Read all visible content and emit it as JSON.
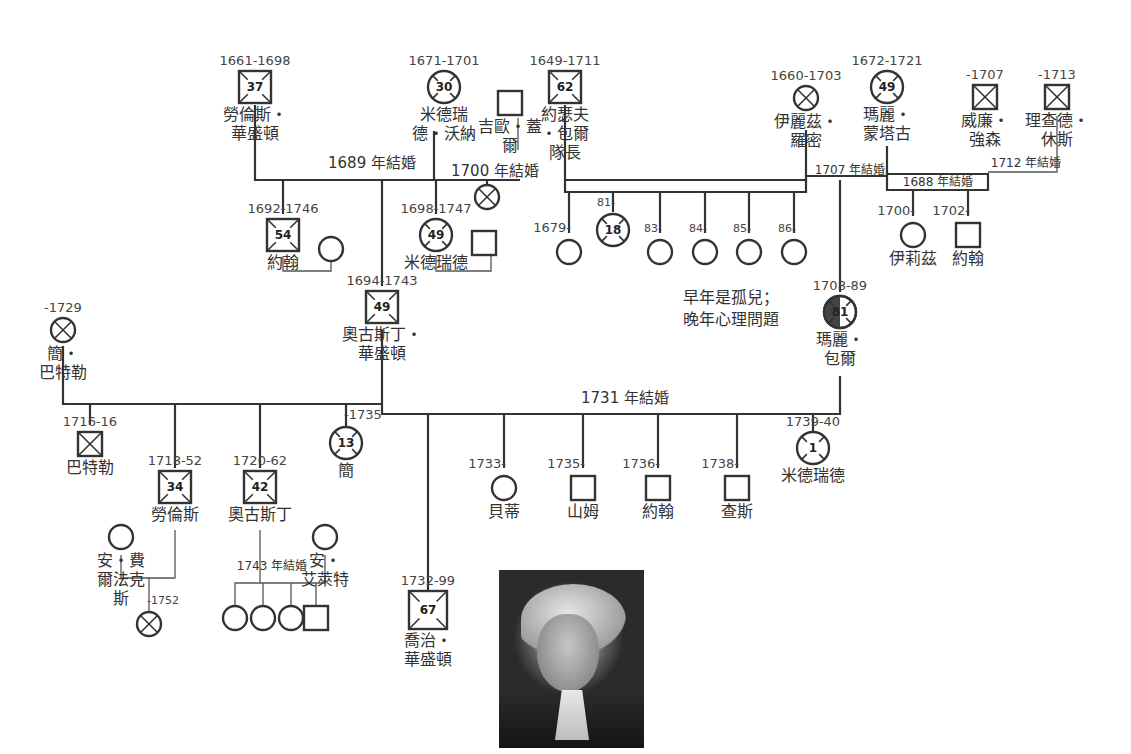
{
  "people": [
    {
      "id": "lawrence_sr",
      "sex": "M",
      "shape": "square",
      "deceased": true,
      "age": "37",
      "x": 255,
      "y": 87,
      "years": "1661-1698",
      "name": [
        "勞倫斯・",
        "華盛頓"
      ]
    },
    {
      "id": "mildred_warner",
      "sex": "F",
      "shape": "circle",
      "deceased": true,
      "age": "30",
      "x": 444,
      "y": 87,
      "years": "1671-1701",
      "name": [
        "米德瑞",
        "德・沃納"
      ]
    },
    {
      "id": "george_gale",
      "sex": "M",
      "shape": "square",
      "deceased": false,
      "x": 510,
      "y": 103,
      "name": [
        "吉歐・蓋",
        "爾"
      ]
    },
    {
      "id": "joseph_ball",
      "sex": "M",
      "shape": "square",
      "deceased": true,
      "age": "62",
      "x": 565,
      "y": 87,
      "years": "1649-1711",
      "name": [
        "約瑟夫",
        "・包爾",
        "隊長"
      ]
    },
    {
      "id": "elizabeth_romney",
      "sex": "F",
      "shape": "circle",
      "deceased": true,
      "x": 806,
      "y": 98,
      "years": "1660-1703",
      "name": [
        "伊麗茲・",
        "羅密"
      ]
    },
    {
      "id": "mary_montague",
      "sex": "F",
      "shape": "circle",
      "deceased": true,
      "age": "49",
      "x": 887,
      "y": 87,
      "years": "1672-1721",
      "name": [
        "瑪麗・",
        "蒙塔古"
      ]
    },
    {
      "id": "william_johnson",
      "sex": "M",
      "shape": "square",
      "deceased": true,
      "x": 985,
      "y": 97,
      "years": "-1707",
      "name": [
        "威廉・",
        "強森"
      ]
    },
    {
      "id": "richard_hughes",
      "sex": "M",
      "shape": "square",
      "deceased": true,
      "x": 1057,
      "y": 97,
      "years": "-1713",
      "name": [
        "理查德・",
        "休斯"
      ]
    },
    {
      "id": "gale_child",
      "sex": "U",
      "shape": "circle",
      "deceased": true,
      "x": 487,
      "y": 197,
      "name": []
    },
    {
      "id": "john_1692",
      "sex": "M",
      "shape": "square",
      "deceased": true,
      "age": "54",
      "x": 283,
      "y": 235,
      "years": "1692-1746",
      "name": [
        "約翰"
      ]
    },
    {
      "id": "john_wife",
      "sex": "F",
      "shape": "circle",
      "deceased": false,
      "x": 331,
      "y": 249,
      "name": []
    },
    {
      "id": "mildred_1698",
      "sex": "F",
      "shape": "circle",
      "deceased": true,
      "age": "49",
      "x": 436,
      "y": 235,
      "years": "1698-1747",
      "name": [
        "米德瑞德"
      ]
    },
    {
      "id": "mildred_husband",
      "sex": "M",
      "shape": "square",
      "deceased": false,
      "x": 484,
      "y": 243,
      "name": []
    },
    {
      "id": "ball_c1679",
      "sex": "F",
      "shape": "circle",
      "deceased": false,
      "x": 569,
      "y": 252,
      "years": "1679-",
      "name": []
    },
    {
      "id": "ball_c81",
      "sex": "F",
      "shape": "circle",
      "deceased": true,
      "age": "18",
      "x": 613,
      "y": 230,
      "years": "81-",
      "name": []
    },
    {
      "id": "ball_c83",
      "sex": "F",
      "shape": "circle",
      "deceased": false,
      "x": 660,
      "y": 252,
      "years": "83-",
      "name": []
    },
    {
      "id": "ball_c84",
      "sex": "F",
      "shape": "circle",
      "deceased": false,
      "x": 705,
      "y": 252,
      "years": "84-",
      "name": []
    },
    {
      "id": "ball_c85",
      "sex": "F",
      "shape": "circle",
      "deceased": false,
      "x": 749,
      "y": 252,
      "years": "85-",
      "name": []
    },
    {
      "id": "ball_c86",
      "sex": "F",
      "shape": "circle",
      "deceased": false,
      "x": 794,
      "y": 252,
      "years": "86-",
      "name": []
    },
    {
      "id": "elizabeth_1700",
      "sex": "F",
      "shape": "circle",
      "deceased": false,
      "x": 913,
      "y": 235,
      "years": "1700-",
      "name": [
        "伊莉茲"
      ]
    },
    {
      "id": "john_1702",
      "sex": "M",
      "shape": "square",
      "deceased": false,
      "x": 968,
      "y": 235,
      "years": "1702-",
      "name": [
        "約翰"
      ]
    },
    {
      "id": "augustine",
      "sex": "M",
      "shape": "square",
      "deceased": true,
      "age": "49",
      "x": 382,
      "y": 307,
      "years": "1694-1743",
      "name": [
        "奧古斯丁・",
        "華盛頓"
      ]
    },
    {
      "id": "mary_ball",
      "sex": "F",
      "shape": "circle",
      "deceased": true,
      "age": "81",
      "half_filled": true,
      "x": 840,
      "y": 312,
      "years": "1708-89",
      "name": [
        "瑪麗・",
        "包爾"
      ]
    },
    {
      "id": "jane_butler",
      "sex": "F",
      "shape": "circle",
      "deceased": true,
      "x": 63,
      "y": 330,
      "years": "-1729",
      "name": [
        "簡・",
        "巴特勒"
      ]
    },
    {
      "id": "butler_1716",
      "sex": "M",
      "shape": "square",
      "deceased": true,
      "x": 90,
      "y": 444,
      "years": "1716-16",
      "name": [
        "巴特勒"
      ]
    },
    {
      "id": "lawrence_1718",
      "sex": "M",
      "shape": "square",
      "deceased": true,
      "age": "34",
      "x": 175,
      "y": 487,
      "years": "1718-52",
      "name": [
        "勞倫斯"
      ]
    },
    {
      "id": "augustine_1720",
      "sex": "M",
      "shape": "square",
      "deceased": true,
      "age": "42",
      "x": 260,
      "y": 487,
      "years": "1720-62",
      "name": [
        "奧古斯丁"
      ]
    },
    {
      "id": "jane_1735",
      "sex": "F",
      "shape": "circle",
      "deceased": true,
      "age": "13",
      "x": 346,
      "y": 443,
      "years": "-1735",
      "name": [
        "簡"
      ]
    },
    {
      "id": "betty",
      "sex": "F",
      "shape": "circle",
      "deceased": false,
      "x": 504,
      "y": 488,
      "years": "1733-",
      "name": [
        "貝蒂"
      ]
    },
    {
      "id": "samuel",
      "sex": "M",
      "shape": "square",
      "deceased": false,
      "x": 583,
      "y": 488,
      "years": "1735-",
      "name": [
        "山姆"
      ]
    },
    {
      "id": "john_1736",
      "sex": "M",
      "shape": "square",
      "deceased": false,
      "x": 658,
      "y": 488,
      "years": "1736-",
      "name": [
        "約翰"
      ]
    },
    {
      "id": "charles",
      "sex": "M",
      "shape": "square",
      "deceased": false,
      "x": 737,
      "y": 488,
      "years": "1738-",
      "name": [
        "查斯"
      ]
    },
    {
      "id": "mildred_1739",
      "sex": "F",
      "shape": "circle",
      "deceased": true,
      "age": "1",
      "x": 813,
      "y": 448,
      "years": "1739-40",
      "name": [
        "米德瑞德"
      ]
    },
    {
      "id": "ann_fairfax",
      "sex": "F",
      "shape": "circle",
      "deceased": false,
      "x": 121,
      "y": 537,
      "name": [
        "安・費",
        "爾法克",
        "斯"
      ]
    },
    {
      "id": "ann_aylett",
      "sex": "F",
      "shape": "circle",
      "deceased": false,
      "x": 325,
      "y": 537,
      "name": [
        "安・",
        "艾萊特"
      ]
    },
    {
      "id": "lawrence_child",
      "sex": "U",
      "shape": "circle",
      "deceased": true,
      "x": 149,
      "y": 624,
      "years": "-1752",
      "name": []
    },
    {
      "id": "aug_c1",
      "sex": "F",
      "shape": "circle",
      "deceased": false,
      "x": 235,
      "y": 618,
      "name": []
    },
    {
      "id": "aug_c2",
      "sex": "F",
      "shape": "circle",
      "deceased": false,
      "x": 263,
      "y": 618,
      "name": []
    },
    {
      "id": "aug_c3",
      "sex": "F",
      "shape": "circle",
      "deceased": false,
      "x": 291,
      "y": 618,
      "name": []
    },
    {
      "id": "aug_c4",
      "sex": "M",
      "shape": "square",
      "deceased": false,
      "x": 316,
      "y": 618,
      "name": []
    },
    {
      "id": "george_washington",
      "sex": "M",
      "shape": "square",
      "deceased": true,
      "age": "67",
      "highlight": true,
      "x": 428,
      "y": 610,
      "years": "1732-99",
      "name": [
        "喬治・",
        "華盛頓"
      ]
    }
  ],
  "marriages": [
    {
      "label": "1689 年結婚",
      "x": 372,
      "y": 168
    },
    {
      "label": "1700 年結婚",
      "x": 495,
      "y": 176
    },
    {
      "label": "1707 年結婚",
      "x": 850,
      "y": 174,
      "small": true
    },
    {
      "label": "1688 年結婚",
      "x": 938,
      "y": 186,
      "small": true
    },
    {
      "label": "1712 年結婚",
      "x": 1026,
      "y": 167,
      "small": true
    },
    {
      "label": "1731 年結婚",
      "x": 625,
      "y": 403
    },
    {
      "label": "1743 年結婚",
      "x": 272,
      "y": 570,
      "small": true
    }
  ],
  "annotations": [
    {
      "id": "mary_ball_note",
      "lines": [
        "早年是孤兒；",
        "晚年心理問題"
      ],
      "x": 731,
      "y": 303
    }
  ],
  "portrait": {
    "subject": "喬治・華盛頓 肖像",
    "alt": "George Washington portrait"
  }
}
